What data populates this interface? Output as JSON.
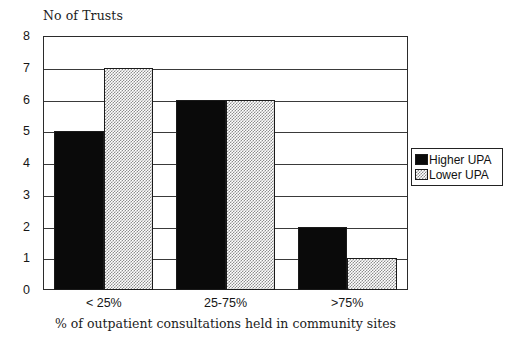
{
  "chart_data": {
    "type": "bar",
    "title": "",
    "ylabel": "No of Trusts",
    "xlabel": "% of outpatient consultations held in community sites",
    "categories": [
      "< 25%",
      "25-75%",
      ">75%"
    ],
    "series": [
      {
        "name": "Higher UPA",
        "values": [
          5,
          6,
          2
        ],
        "color": "#0a0a0a",
        "fill": "solid-black"
      },
      {
        "name": "Lower UPA",
        "values": [
          7,
          6,
          1
        ],
        "color": "#8d8d8d",
        "fill": "checkerboard-gray"
      }
    ],
    "ylim": [
      0,
      8
    ],
    "y_ticks": [
      "0",
      "1",
      "2",
      "3",
      "4",
      "5",
      "6",
      "7",
      "8"
    ],
    "grid": "horizontal",
    "legend_position": "right"
  },
  "legend": {
    "entries": [
      {
        "label": "Higher UPA",
        "swatch": "solid-black-swatch"
      },
      {
        "label": "Lower UPA",
        "swatch": "checkerboard-gray-swatch"
      }
    ]
  }
}
